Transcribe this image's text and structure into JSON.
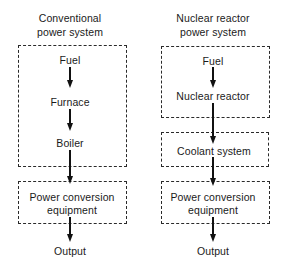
{
  "diagram": {
    "left": {
      "title_line1": "Conventional",
      "title_line2": "power system",
      "nodes": {
        "fuel": "Fuel",
        "furnace": "Furnace",
        "boiler": "Boiler",
        "conversion_line1": "Power conversion",
        "conversion_line2": "equipment",
        "output": "Output"
      },
      "groups": [
        {
          "name": "combustion-group",
          "contains": [
            "Fuel",
            "Furnace",
            "Boiler"
          ]
        },
        {
          "name": "power-conversion-group",
          "contains": [
            "Power conversion equipment"
          ]
        }
      ],
      "flow": [
        "Fuel",
        "Furnace",
        "Boiler",
        "Power conversion equipment",
        "Output"
      ]
    },
    "right": {
      "title_line1": "Nuclear reactor",
      "title_line2": "power system",
      "nodes": {
        "fuel": "Fuel",
        "reactor": "Nuclear reactor",
        "coolant": "Coolant system",
        "conversion_line1": "Power conversion",
        "conversion_line2": "equipment",
        "output": "Output"
      },
      "groups": [
        {
          "name": "reactor-group",
          "contains": [
            "Fuel",
            "Nuclear reactor"
          ]
        },
        {
          "name": "coolant-group",
          "contains": [
            "Coolant system"
          ]
        },
        {
          "name": "power-conversion-group",
          "contains": [
            "Power conversion equipment"
          ]
        }
      ],
      "flow": [
        "Fuel",
        "Nuclear reactor",
        "Coolant system",
        "Power conversion equipment",
        "Output"
      ]
    },
    "colors": {
      "line": "#111111",
      "dash": "#2a2a2a",
      "text": "#1a1a1a",
      "background": "#ffffff"
    }
  }
}
